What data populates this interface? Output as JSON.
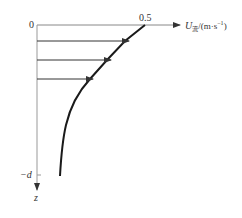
{
  "diagram": {
    "type": "velocity-profile",
    "origin_label": "0",
    "x_tick_label": "0.5",
    "x_axis_label": {
      "symbol": "U",
      "subscript": "流",
      "unit": "/(m·s",
      "unit_exp": "−1",
      "unit_close": ")"
    },
    "depth_label": "−d",
    "z_axis_label": "z",
    "arrows_count": 3,
    "colors": {
      "axis": "#888888",
      "curve": "#1a1a1a",
      "arrow": "#333333",
      "text": "#333333"
    }
  }
}
